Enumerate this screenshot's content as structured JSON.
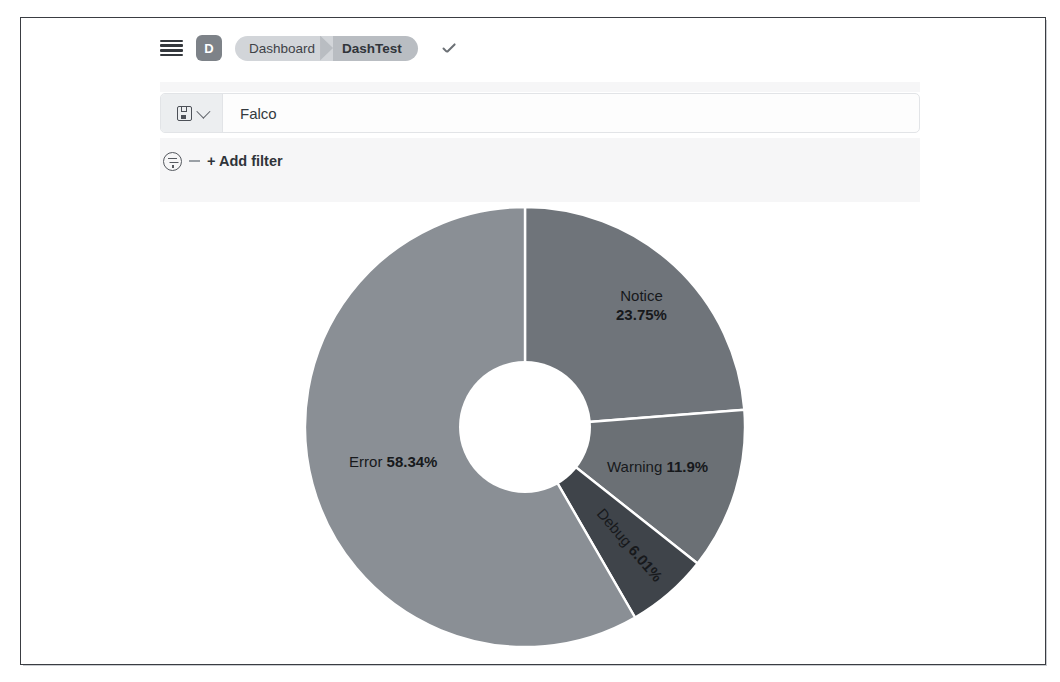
{
  "nav": {
    "menu_icon": "hamburger-menu-icon",
    "app_badge": "D",
    "breadcrumbs": [
      {
        "label": "Dashboard",
        "active": false
      },
      {
        "label": "DashTest",
        "active": true
      }
    ],
    "confirm_icon": "check-icon"
  },
  "query_bar": {
    "saved_query_icon": "disk-save-icon",
    "dropdown_icon": "chevron-down-icon",
    "value": "Falco",
    "placeholder": "Search"
  },
  "filters": {
    "filter_icon": "filter-funnel-icon",
    "add_filter_label": "+ Add filter"
  },
  "chart_data": {
    "type": "pie",
    "variant": "donut",
    "title": "",
    "categories": [
      "Notice",
      "Warning",
      "Debug",
      "Error"
    ],
    "values": [
      23.75,
      11.9,
      6.01,
      58.34
    ],
    "unit": "%",
    "labels": [
      {
        "name": "Notice",
        "value": "23.75%",
        "display": "Notice 23.75%"
      },
      {
        "name": "Warning",
        "value": "11.9%",
        "display": "Warning 11.9%"
      },
      {
        "name": "Debug",
        "value": "6.01%",
        "display": "Debug 6.01%"
      },
      {
        "name": "Error",
        "value": "58.34%",
        "display": "Error 58.34%"
      }
    ],
    "colors": [
      "#6f747a",
      "#6b7075",
      "#3f444a",
      "#8a8f95"
    ],
    "legend": "none",
    "start_angle_deg": 0,
    "direction": "clockwise",
    "inner_radius_ratio": 0.3
  },
  "theme": {
    "page_border": "#3a3d42",
    "badge_bg": "#7d8288",
    "crumb_inactive_bg": "#d2d5d9",
    "crumb_active_bg": "#b9bdc2",
    "query_bar_bg": "#fdfdfd"
  }
}
